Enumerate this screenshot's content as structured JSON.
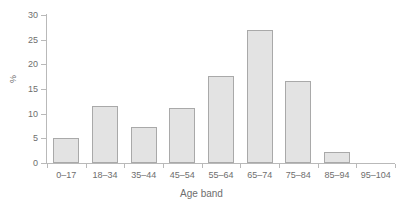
{
  "chart_data": {
    "type": "bar",
    "title": "",
    "subtitle": "",
    "xlabel": "Age band",
    "ylabel": "%",
    "categories": [
      "0–17",
      "18–34",
      "35–44",
      "45–54",
      "55–64",
      "65–74",
      "75–84",
      "85–94",
      "95–104"
    ],
    "values": [
      5.0,
      11.6,
      7.3,
      11.1,
      17.6,
      27.0,
      16.6,
      2.2,
      0.0
    ],
    "ylim": [
      0,
      30
    ],
    "ytick_labels": [
      "0",
      "5",
      "10",
      "15",
      "20",
      "25",
      "30"
    ],
    "ytick_values": [
      0,
      5,
      10,
      15,
      20,
      25,
      30
    ],
    "grid": false,
    "legend": "none",
    "series": [
      {
        "name": "Percentage by age band",
        "values": [
          5.0,
          11.6,
          7.3,
          11.1,
          17.6,
          27.0,
          16.6,
          2.2,
          0.0
        ]
      }
    ],
    "colors": {
      "bar_fill": "#e3e3e3",
      "bar_border": "#a9a9a9",
      "axis": "#b9b9b9",
      "text": "#6e6e6e",
      "background": "#ffffff"
    }
  }
}
